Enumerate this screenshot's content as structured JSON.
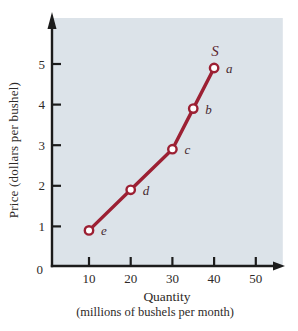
{
  "chart_data": {
    "type": "line",
    "title": "",
    "xlabel": "Quantity",
    "xlabel_sub": "(millions of bushels per month)",
    "ylabel": "Price (dollars per bushel)",
    "xlim": [
      0,
      55
    ],
    "ylim": [
      0,
      5.9
    ],
    "grid": false,
    "legend": "none",
    "x_ticks": [
      "10",
      "20",
      "30",
      "40",
      "50"
    ],
    "y_ticks": [
      "1",
      "2",
      "3",
      "4",
      "5"
    ],
    "origin_label": "0",
    "curve_label": "S",
    "series": [
      {
        "name": "S",
        "points": [
          {
            "label": "e",
            "x": 10,
            "y": 1
          },
          {
            "label": "d",
            "x": 20,
            "y": 2
          },
          {
            "label": "c",
            "x": 30,
            "y": 3
          },
          {
            "label": "b",
            "x": 35,
            "y": 4
          },
          {
            "label": "a",
            "x": 40,
            "y": 5
          }
        ]
      }
    ],
    "colors": {
      "plot_background": "#dce3e9",
      "axis": "#1c1c1c",
      "curve": "#9c2033",
      "marker_fill": "#ffffff",
      "tick_text": "#2e2a28",
      "point_label_text": "#46292f",
      "curve_label_text": "#5c2630"
    }
  }
}
